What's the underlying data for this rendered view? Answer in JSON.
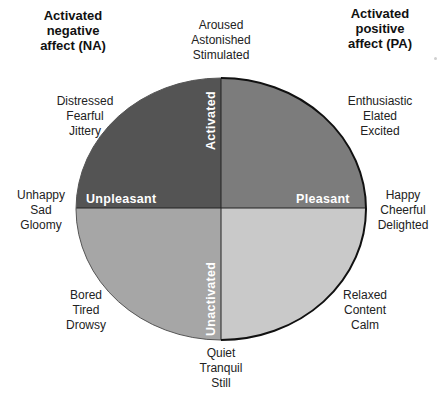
{
  "corner_labels": {
    "top_left": [
      "Activated",
      "negative",
      "affect (NA)"
    ],
    "top_right": [
      "Activated",
      "positive",
      "affect (PA)"
    ]
  },
  "axes": {
    "top": "Activated",
    "bottom": "Unactivated",
    "left": "Unpleasant",
    "right": "Pleasant"
  },
  "quadrant_colors": {
    "top_left": "#545454",
    "top_right": "#7c7c7c",
    "bottom_left": "#a6a6a6",
    "bottom_right": "#c9c9c9",
    "outline": "#111111"
  },
  "affect_clusters": {
    "top": [
      "Aroused",
      "Astonished",
      "Stimulated"
    ],
    "top_left": [
      "Distressed",
      "Fearful",
      "Jittery"
    ],
    "top_right": [
      "Enthusiastic",
      "Elated",
      "Excited"
    ],
    "left": [
      "Unhappy",
      "Sad",
      "Gloomy"
    ],
    "right": [
      "Happy",
      "Cheerful",
      "Delighted"
    ],
    "bottom_left": [
      "Bored",
      "Tired",
      "Drowsy"
    ],
    "bottom_right": [
      "Relaxed",
      "Content",
      "Calm"
    ],
    "bottom": [
      "Quiet",
      "Tranquil",
      "Still"
    ]
  }
}
